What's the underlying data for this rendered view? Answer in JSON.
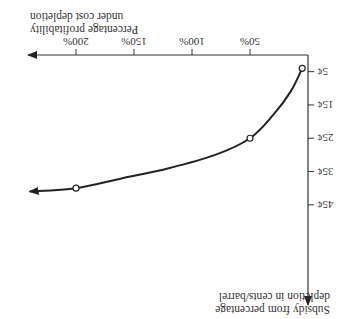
{
  "chart_data": {
    "type": "line",
    "orientation_note_visible": "rendered rotated 180 degrees",
    "xlabel": "Percentage profitability under cost depletion",
    "xlabel_lines": [
      "Percentage profitability",
      "under cost depletion"
    ],
    "ylabel": "Subsidy from percentage depletion in cents/barrel",
    "ylabel_lines": [
      "Subsidy from percentage",
      "depletion in cents/barrel"
    ],
    "x_ticks": [
      "50%",
      "100%",
      "150%",
      "200%"
    ],
    "x_tick_values": [
      50,
      100,
      150,
      200
    ],
    "y_ticks": [
      "5¢",
      "15¢",
      "25¢",
      "35¢",
      "45¢"
    ],
    "y_tick_values": [
      5,
      15,
      25,
      35,
      45
    ],
    "xlim": [
      0,
      240
    ],
    "ylim": [
      0,
      50
    ],
    "series": [
      {
        "name": "subsidy curve",
        "marked_points": [
          {
            "x": 5,
            "y": 4
          },
          {
            "x": 50,
            "y": 25
          },
          {
            "x": 200,
            "y": 40
          }
        ],
        "curve": [
          {
            "x": 5,
            "y": 4
          },
          {
            "x": 15,
            "y": 11
          },
          {
            "x": 30,
            "y": 18
          },
          {
            "x": 50,
            "y": 25
          },
          {
            "x": 80,
            "y": 30
          },
          {
            "x": 120,
            "y": 34
          },
          {
            "x": 160,
            "y": 37
          },
          {
            "x": 200,
            "y": 40
          },
          {
            "x": 240,
            "y": 41
          }
        ],
        "ends_with_arrow": true
      }
    ],
    "grid": false,
    "legend": null
  }
}
